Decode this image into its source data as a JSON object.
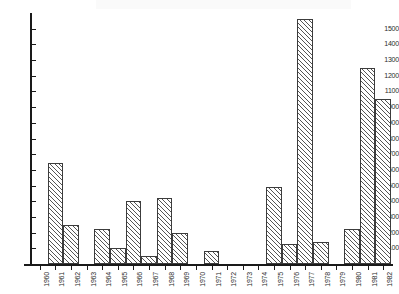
{
  "chart_data": {
    "type": "bar",
    "title": "",
    "subtitle": "",
    "xlabel": "",
    "ylabel": "",
    "categories": [
      "1960",
      "1961",
      "1962",
      "1963",
      "1964",
      "1965",
      "1966",
      "1967",
      "1968",
      "1969",
      "1970",
      "1971",
      "1972",
      "1973",
      "1974",
      "1975",
      "1976",
      "1977",
      "1978",
      "1979",
      "1980",
      "1981",
      "1982"
    ],
    "values": [
      0,
      645,
      250,
      0,
      225,
      100,
      400,
      50,
      420,
      200,
      0,
      80,
      0,
      0,
      0,
      490,
      125,
      1560,
      140,
      0,
      225,
      1250,
      1050
    ],
    "ylim": [
      0,
      1600
    ],
    "xlim_labels": [
      "1960",
      "1982"
    ],
    "y_ticks": [
      100,
      200,
      300,
      400,
      500,
      600,
      700,
      800,
      900,
      1000,
      1100,
      1200,
      1300,
      1400,
      1500
    ],
    "y_tick_labels": [
      "100",
      "200",
      "300",
      "400",
      "500",
      "600",
      "700",
      "800",
      "900",
      "1000",
      "1100",
      "1200",
      "1300",
      "1400",
      "1500"
    ],
    "grid": false,
    "legend": null,
    "legend_position": "none",
    "annotations": [],
    "series": [
      {
        "name": "",
        "values": [
          0,
          645,
          250,
          0,
          225,
          100,
          400,
          50,
          420,
          200,
          0,
          80,
          0,
          0,
          0,
          490,
          125,
          1560,
          140,
          0,
          225,
          1250,
          1050
        ]
      }
    ],
    "style": {
      "bar_fill": "#ffffff",
      "bar_hatch": "diagonal-45",
      "bar_edge_color": "#3c3c3c",
      "axis_color": "#1a1a1a",
      "background": "#ffffff",
      "tick_label_color": "#2b2b2b"
    }
  }
}
